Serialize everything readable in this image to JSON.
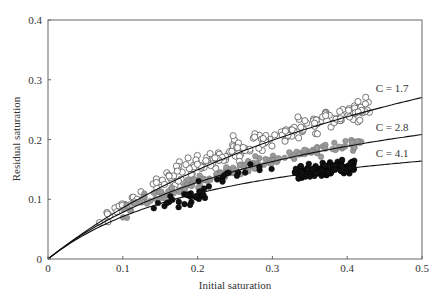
{
  "chart_data": {
    "type": "scatter",
    "title": "",
    "xlabel": "Initial saturation",
    "ylabel": "Residual saturation",
    "xlim": [
      0,
      0.5
    ],
    "ylim": [
      0,
      0.4
    ],
    "xticks": [
      0,
      0.1,
      0.2,
      0.3,
      0.4,
      0.5
    ],
    "xtick_labels": [
      "0",
      "0.1",
      "0.2",
      "0.3",
      "0.4",
      "0.5"
    ],
    "yticks": [
      0,
      0.1,
      0.2,
      0.3,
      0.4
    ],
    "ytick_labels": [
      "0",
      "0.1",
      "0.2",
      "0.3",
      "0.4"
    ],
    "grid": false,
    "legend": null,
    "curves": [
      {
        "name": "C = 1.7",
        "model": "Sr = Si / (1 + C*Si)",
        "C": 1.7,
        "label": "C = 1.7",
        "label_pos": [
          0.46,
          0.28
        ]
      },
      {
        "name": "C = 2.8",
        "model": "Sr = Si / (1 + C*Si)",
        "C": 2.8,
        "label": "C = 2.8",
        "label_pos": [
          0.46,
          0.215
        ]
      },
      {
        "name": "C = 4.1",
        "model": "Sr = Si / (1 + C*Si)",
        "C": 4.1,
        "label": "C = 4.1",
        "label_pos": [
          0.46,
          0.17
        ]
      }
    ],
    "series": [
      {
        "name": "open circles",
        "marker": "open-circle",
        "color": "#ffffff",
        "edge": "#555555",
        "clusters": [
          {
            "x_range": [
              0.06,
              0.14
            ],
            "center_C": 1.5,
            "spread": 0.012,
            "n": 22
          },
          {
            "x_range": [
              0.14,
              0.25
            ],
            "center_C": 1.35,
            "spread": 0.018,
            "n": 70
          },
          {
            "x_range": [
              0.25,
              0.43
            ],
            "center_C": 1.6,
            "spread": 0.017,
            "n": 110
          }
        ]
      },
      {
        "name": "grey circles",
        "marker": "filled-circle",
        "color": "#9a9a9a",
        "edge": "#777777",
        "clusters": [
          {
            "x_range": [
              0.1,
              0.2
            ],
            "center_C": 2.6,
            "spread": 0.012,
            "n": 45
          },
          {
            "x_range": [
              0.2,
              0.42
            ],
            "center_C": 2.7,
            "spread": 0.01,
            "n": 110
          }
        ]
      },
      {
        "name": "black circles",
        "marker": "filled-circle",
        "color": "#111111",
        "edge": "#000000",
        "clusters": [
          {
            "x_range": [
              0.14,
              0.22
            ],
            "center_C": 4.4,
            "spread": 0.012,
            "n": 30
          },
          {
            "x_range": [
              0.2,
              0.3
            ],
            "center_C": 3.0,
            "spread": 0.01,
            "n": 14
          },
          {
            "x_range": [
              0.33,
              0.41
            ],
            "center_C": 4.0,
            "spread": 0.011,
            "n": 130
          }
        ]
      }
    ]
  },
  "plot_area": {
    "left": 48,
    "right": 422,
    "top": 20,
    "bottom": 259
  }
}
